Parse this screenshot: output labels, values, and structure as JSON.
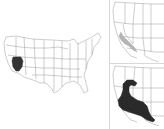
{
  "figure": {
    "type": "species range map",
    "panels": [
      {
        "id": "main",
        "region": "contiguous United States",
        "highlight": "southern California / southern Nevada",
        "highlight_color": "#333333"
      },
      {
        "id": "inset-top",
        "region": "western United States",
        "highlight": "narrow strip along California-Nevada border toward southern California",
        "highlight_color": "#b0b0b0"
      },
      {
        "id": "inset-bottom",
        "region": "western United States",
        "highlight": "large range across Nevada, southern California, Arizona and northern Mexico",
        "highlight_color": "#222222"
      }
    ]
  },
  "colors": {
    "background": "#ffffff",
    "state_line": "#9a9a9a",
    "range_dark": "#2a2a2a",
    "range_light": "#b4b4b4",
    "divider": "#d8d8d8"
  }
}
